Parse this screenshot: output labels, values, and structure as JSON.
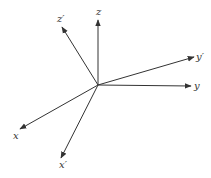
{
  "diagram": {
    "title": "",
    "origin": [
      98,
      85
    ],
    "axes": [
      {
        "name": "z",
        "label": "z",
        "tip": [
          98,
          20
        ],
        "label_pos": [
          96,
          15
        ]
      },
      {
        "name": "z-prime",
        "label": "z′",
        "tip": [
          62,
          27
        ],
        "label_pos": [
          57,
          22
        ]
      },
      {
        "name": "y-prime",
        "label": "y′",
        "tip": [
          194,
          57
        ],
        "label_pos": [
          196,
          60
        ]
      },
      {
        "name": "y",
        "label": "y",
        "tip": [
          191,
          86
        ],
        "label_pos": [
          194,
          89
        ]
      },
      {
        "name": "x",
        "label": "x",
        "tip": [
          20,
          129
        ],
        "label_pos": [
          13,
          139
        ]
      },
      {
        "name": "x-prime",
        "label": "x′",
        "tip": [
          61,
          158
        ],
        "label_pos": [
          59,
          168
        ]
      }
    ],
    "colors": {
      "line": "#333333",
      "background": "#ffffff"
    }
  }
}
